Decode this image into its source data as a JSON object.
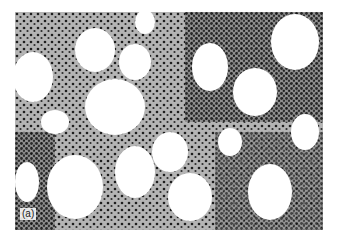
{
  "figure": {
    "panel_label": "(a)"
  }
}
